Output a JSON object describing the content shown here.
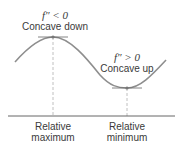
{
  "diagram": {
    "max_annotation": {
      "condition": "f″ < 0",
      "description": "Concave down"
    },
    "min_annotation": {
      "condition": "f″ > 0",
      "description": "Concave up"
    },
    "axis_labels": {
      "maximum": {
        "line1": "Relative",
        "line2": "maximum"
      },
      "minimum": {
        "line1": "Relative",
        "line2": "minimum"
      }
    },
    "colors": {
      "curve": "#8a8a8a",
      "axis": "#555555",
      "dashed": "#aaaaaa",
      "text": "#3a3a3a"
    }
  }
}
